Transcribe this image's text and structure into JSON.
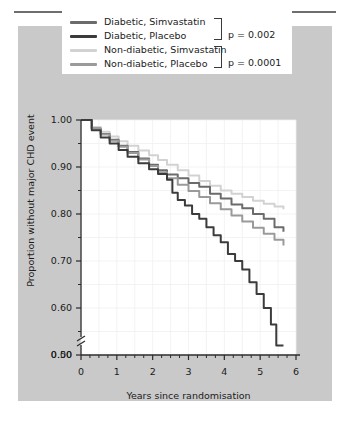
{
  "figure": {
    "background_color": "#c9c9c9",
    "plot_background": "#ffffff",
    "rule_color": "#6e6e6e"
  },
  "legend": {
    "entries": [
      {
        "label": "Diabetic, Simvastatin",
        "color": "#6b6b6b"
      },
      {
        "label": "Diabetic, Placebo",
        "color": "#3b3b3b"
      },
      {
        "label": "Non-diabetic, Simvastatin",
        "color": "#d2d2d2"
      },
      {
        "label": "Non-diabetic, Placebo",
        "color": "#9a9a9a"
      }
    ],
    "pvalues": [
      {
        "text": "p = 0.002",
        "applies_to": [
          "Diabetic, Simvastatin",
          "Diabetic, Placebo"
        ]
      },
      {
        "text": "p = 0.0001",
        "applies_to": [
          "Non-diabetic, Simvastatin",
          "Non-diabetic, Placebo"
        ]
      }
    ]
  },
  "chart_data": {
    "type": "line",
    "title": "",
    "subtitle": "",
    "xlabel": "Years since randomisation",
    "ylabel": "Proportion without major CHD event",
    "xlim": [
      0,
      6
    ],
    "ylim": [
      0.5,
      1.0
    ],
    "y_axis_break": true,
    "y_break_label": "0.00",
    "grid": true,
    "legend_position": "top",
    "xticks": [
      0,
      1,
      2,
      3,
      4,
      5,
      6
    ],
    "xtick_labels": [
      "0",
      "1",
      "2",
      "3",
      "4",
      "5",
      "6"
    ],
    "x_minor_step": 0.25,
    "yticks": [
      0.5,
      0.6,
      0.7,
      0.8,
      0.9,
      1.0
    ],
    "ytick_labels": [
      "0.50",
      "0.60",
      "0.70",
      "0.80",
      "0.90",
      "1.00"
    ],
    "y_minor_step": 0.05,
    "step_style": "post",
    "series": [
      {
        "name": "Non-diabetic, Simvastatin",
        "color": "#d2d2d2",
        "end_value": 0.81,
        "x": [
          0,
          0.3,
          0.55,
          0.8,
          1.05,
          1.3,
          1.6,
          1.9,
          2.15,
          2.4,
          2.7,
          3.0,
          3.3,
          3.6,
          3.9,
          4.2,
          4.5,
          4.8,
          5.1,
          5.4,
          5.65
        ],
        "y": [
          1.0,
          0.985,
          0.975,
          0.965,
          0.955,
          0.945,
          0.935,
          0.925,
          0.915,
          0.905,
          0.893,
          0.882,
          0.87,
          0.86,
          0.85,
          0.843,
          0.836,
          0.828,
          0.822,
          0.816,
          0.81
        ]
      },
      {
        "name": "Diabetic, Simvastatin",
        "color": "#6b6b6b",
        "end_value": 0.76,
        "x": [
          0,
          0.3,
          0.55,
          0.8,
          1.05,
          1.3,
          1.6,
          1.9,
          2.15,
          2.4,
          2.7,
          3.0,
          3.3,
          3.6,
          3.9,
          4.2,
          4.5,
          4.8,
          5.1,
          5.4,
          5.65
        ],
        "y": [
          1.0,
          0.982,
          0.97,
          0.958,
          0.945,
          0.932,
          0.918,
          0.905,
          0.893,
          0.884,
          0.876,
          0.866,
          0.858,
          0.843,
          0.833,
          0.82,
          0.812,
          0.8,
          0.79,
          0.772,
          0.762
        ]
      },
      {
        "name": "Non-diabetic, Placebo",
        "color": "#9a9a9a",
        "end_value": 0.73,
        "x": [
          0,
          0.3,
          0.55,
          0.8,
          1.05,
          1.3,
          1.6,
          1.9,
          2.15,
          2.4,
          2.7,
          3.0,
          3.3,
          3.6,
          3.9,
          4.2,
          4.5,
          4.8,
          5.1,
          5.4,
          5.65
        ],
        "y": [
          1.0,
          0.982,
          0.969,
          0.956,
          0.943,
          0.93,
          0.916,
          0.902,
          0.889,
          0.876,
          0.862,
          0.849,
          0.836,
          0.823,
          0.81,
          0.797,
          0.784,
          0.771,
          0.758,
          0.745,
          0.733
        ]
      },
      {
        "name": "Diabetic, Placebo",
        "color": "#3b3b3b",
        "end_value": 0.52,
        "x": [
          0,
          0.3,
          0.55,
          0.8,
          1.05,
          1.3,
          1.6,
          1.9,
          2.15,
          2.4,
          2.55,
          2.7,
          2.9,
          3.1,
          3.3,
          3.5,
          3.7,
          3.9,
          4.1,
          4.3,
          4.5,
          4.7,
          4.9,
          5.1,
          5.3,
          5.45,
          5.65
        ],
        "y": [
          1.0,
          0.978,
          0.963,
          0.95,
          0.936,
          0.922,
          0.908,
          0.895,
          0.885,
          0.873,
          0.845,
          0.83,
          0.818,
          0.8,
          0.79,
          0.772,
          0.755,
          0.74,
          0.715,
          0.7,
          0.682,
          0.655,
          0.63,
          0.6,
          0.565,
          0.52,
          0.52
        ]
      }
    ]
  }
}
